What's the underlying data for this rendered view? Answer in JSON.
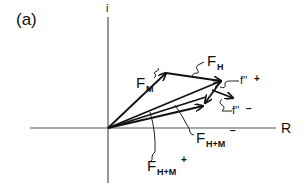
{
  "panel_label": "(a)",
  "axes": {
    "vertical_label": "i",
    "horizontal_label": "R"
  },
  "vectors": {
    "f_m": {
      "base": "F",
      "sub": "M",
      "sup": ""
    },
    "f_h": {
      "base": "F",
      "sub": "H",
      "sup": ""
    },
    "f_hm_plus": {
      "base": "F",
      "sub": "H+M",
      "sup": "+"
    },
    "f_hm_minus": {
      "base": "F",
      "sub": "H+M",
      "sup": "−"
    },
    "fpp_plus": {
      "base": "f''",
      "sup": "+"
    },
    "fpp_minus": {
      "base": "f''",
      "sup": "−"
    }
  },
  "colors": {
    "ink": "#111111",
    "axis": "#555555",
    "background": "#ffffff"
  }
}
